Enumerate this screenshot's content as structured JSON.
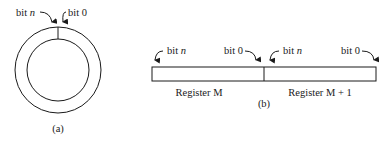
{
  "figure_a": {
    "caption": "(a)",
    "label_left": "bit",
    "label_left_var": "n",
    "label_right": "bit 0"
  },
  "figure_b": {
    "caption": "(b)",
    "registers": [
      {
        "name": "Register",
        "suffix": "M",
        "bit_high": "bit",
        "bit_high_var": "n",
        "bit_low": "bit 0"
      },
      {
        "name": "Register",
        "suffix": "M + 1",
        "bit_high": "bit",
        "bit_high_var": "n",
        "bit_low": "bit 0"
      }
    ]
  },
  "colors": {
    "stroke": "#1a1a1a",
    "background": "#ffffff"
  }
}
